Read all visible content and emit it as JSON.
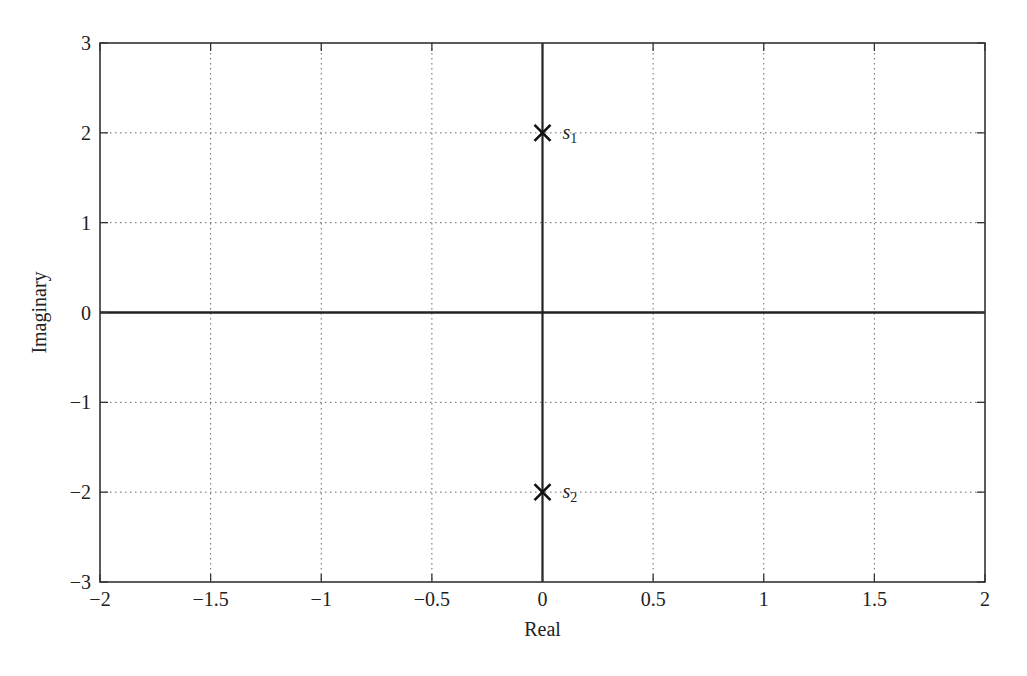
{
  "chart_data": {
    "type": "scatter",
    "title": "",
    "xlabel": "Real",
    "ylabel": "Imaginary",
    "xlim": [
      -2,
      2
    ],
    "ylim": [
      -3,
      3
    ],
    "grid": true,
    "grid_style": "dotted",
    "x_ticks": [
      -2,
      -1.5,
      -1,
      -0.5,
      0,
      0.5,
      1,
      1.5,
      2
    ],
    "x_tick_labels": [
      "−2",
      "−1.5",
      "−1",
      "−0.5",
      "0",
      "0.5",
      "1",
      "1.5",
      "2"
    ],
    "y_ticks": [
      -3,
      -2,
      -1,
      0,
      1,
      2,
      3
    ],
    "y_tick_labels": [
      "−3",
      "−2",
      "−1",
      "0",
      "1",
      "2",
      "3"
    ],
    "zero_axes_drawn": true,
    "marker": "x",
    "series": [
      {
        "name": "poles",
        "points": [
          {
            "x": 0,
            "y": 2,
            "label": "s",
            "subscript": "1"
          },
          {
            "x": 0,
            "y": -2,
            "label": "s",
            "subscript": "2"
          }
        ]
      }
    ],
    "legend": null
  },
  "colors": {
    "axes": "#333333",
    "grid": "#666666",
    "marker": "#111111",
    "background": "#ffffff"
  }
}
